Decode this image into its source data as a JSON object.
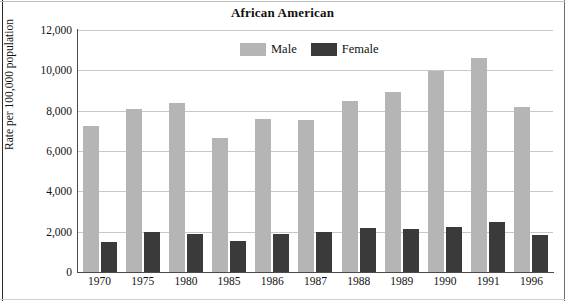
{
  "figure": {
    "title": "African American"
  },
  "legend": {
    "position": "top-center",
    "items": [
      {
        "label": "Male",
        "color": "#b5b5b5",
        "swatch_name": "legend-swatch-male"
      },
      {
        "label": "Female",
        "color": "#3a3a3a",
        "swatch_name": "legend-swatch-female"
      }
    ]
  },
  "axes": {
    "y_title": "Rate per 100,000 population",
    "y_ticks": [
      "0",
      "2,000",
      "4,000",
      "6,000",
      "8,000",
      "10,000",
      "12,000"
    ],
    "y_tick_values": [
      0,
      2000,
      4000,
      6000,
      8000,
      10000,
      12000
    ],
    "x_title": "",
    "x_ticks": [
      "1970",
      "1975",
      "1980",
      "1985",
      "1986",
      "1987",
      "1988",
      "1989",
      "1990",
      "1991",
      "1996"
    ]
  },
  "chart_data": {
    "type": "bar",
    "title": "African American",
    "subtitle": "",
    "xlabel": "",
    "ylabel": "Rate per 100,000 population",
    "ylim": [
      0,
      12000
    ],
    "ytick_step": 2000,
    "grid": true,
    "legend_position": "top-center",
    "categories": [
      "1970",
      "1975",
      "1980",
      "1985",
      "1986",
      "1987",
      "1988",
      "1989",
      "1990",
      "1991",
      "1996"
    ],
    "series": [
      {
        "name": "Male",
        "color": "#b5b5b5",
        "values": [
          7250,
          8100,
          8400,
          6640,
          7600,
          7550,
          8500,
          8950,
          9970,
          10600,
          8200
        ]
      },
      {
        "name": "Female",
        "color": "#3a3a3a",
        "values": [
          1500,
          2000,
          1900,
          1520,
          1900,
          1980,
          2180,
          2120,
          2250,
          2480,
          1830
        ]
      }
    ]
  }
}
